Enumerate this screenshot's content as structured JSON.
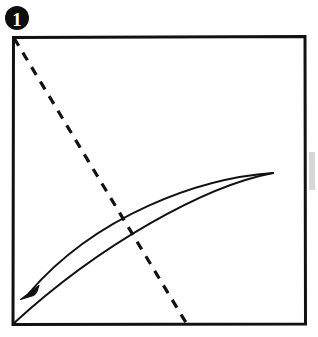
{
  "diagram": {
    "step_number": "1",
    "badge": {
      "name": "step-number-badge",
      "shape": "filled-circle",
      "center_x": 17,
      "center_y": 18,
      "radius": 12,
      "fill_color": "#0d0d0d",
      "text_color": "#ffffff"
    },
    "background_color": "#ffffff",
    "ink_color": "#111111",
    "paper": {
      "label": "square paper sheet",
      "left": 12,
      "top": 36,
      "right": 306,
      "bottom": 325,
      "stroke_color": "#111111",
      "stroke_width": 3,
      "fill_color": "#ffffff"
    },
    "fold_line": {
      "label": "valley fold crease line",
      "style": "dashed",
      "stroke_color": "#111111",
      "stroke_width": 3.2,
      "dash_length": 9,
      "dash_gap": 8,
      "start_x": 14,
      "start_y": 38,
      "end_x": 188,
      "end_y": 326
    },
    "fold_arrow": {
      "label": "fold direction arrow",
      "stroke_color": "#111111",
      "stroke_width": 1.9,
      "tip_x": 273,
      "tip_y": 173,
      "upper_arc_end_x": 26,
      "upper_arc_end_y": 296,
      "lower_arc_end_x": 13,
      "lower_arc_end_y": 324,
      "arrowhead": {
        "name": "arrowhead",
        "tip_x": 21,
        "tip_y": 299,
        "fill_color": "#111111",
        "length": 19
      }
    },
    "scan_artifact": {
      "label": "scan edge smudge",
      "x": 309,
      "y": 152,
      "width": 6,
      "height": 38,
      "color": "#c9c9c9"
    }
  }
}
